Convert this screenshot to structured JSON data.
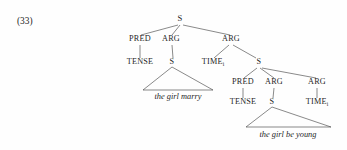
{
  "figure": {
    "example_number": "(33)",
    "caption_text": "",
    "type": "syntax-tree"
  },
  "tree": {
    "root": {
      "label": "S",
      "x": 180,
      "y": 21
    },
    "level1": [
      {
        "name": "pred-left",
        "label": "PRED",
        "x": 140,
        "y": 41
      },
      {
        "name": "arg-left",
        "label": "ARG",
        "x": 171,
        "y": 41
      },
      {
        "name": "arg-right",
        "label": "ARG",
        "x": 231,
        "y": 41
      }
    ],
    "level2": [
      {
        "name": "tense-left",
        "label": "TENSE",
        "x": 140,
        "y": 64
      },
      {
        "name": "s-left",
        "label": "S",
        "x": 172,
        "y": 64
      },
      {
        "name": "time-mid",
        "label": "TIME",
        "subscript": "i",
        "x": 213,
        "y": 64
      },
      {
        "name": "s-right",
        "label": "S",
        "x": 259,
        "y": 64
      }
    ],
    "level3": [
      {
        "name": "pred-embedded",
        "label": "PRED",
        "x": 243,
        "y": 84
      },
      {
        "name": "arg-embedded1",
        "label": "ARG",
        "x": 274,
        "y": 84
      },
      {
        "name": "arg-embedded2",
        "label": "ARG",
        "x": 317,
        "y": 84
      }
    ],
    "level4": [
      {
        "name": "tense-embedded",
        "label": "TENSE",
        "x": 243,
        "y": 104
      },
      {
        "name": "s-embedded",
        "label": "S",
        "x": 272,
        "y": 104
      },
      {
        "name": "time-embedded",
        "label": "TIME",
        "subscript": "i",
        "x": 317,
        "y": 104
      }
    ],
    "terminals": [
      {
        "name": "terminal-the-girl-marry",
        "text": "the girl marry",
        "apex_x": 172,
        "apex_y": 67,
        "left_x": 143,
        "right_x": 213,
        "base_y": 90,
        "text_x": 178,
        "text_y": 99
      },
      {
        "name": "terminal-the-girl-be-young",
        "text": "the girl be young",
        "apex_x": 272,
        "apex_y": 107,
        "left_x": 246,
        "right_x": 331,
        "base_y": 127,
        "text_x": 288,
        "text_y": 137
      }
    ],
    "edges": [
      {
        "name": "edge-root-pred-left",
        "x1": 178,
        "y1": 25,
        "x2": 141,
        "y2": 35
      },
      {
        "name": "edge-root-arg-left",
        "x1": 180,
        "y1": 25,
        "x2": 172,
        "y2": 35
      },
      {
        "name": "edge-root-arg-right",
        "x1": 183,
        "y1": 25,
        "x2": 230,
        "y2": 35
      },
      {
        "name": "edge-pred-left-tense",
        "x1": 140,
        "y1": 45,
        "x2": 140,
        "y2": 58
      },
      {
        "name": "edge-arg-left-s",
        "x1": 172,
        "y1": 45,
        "x2": 173,
        "y2": 58
      },
      {
        "name": "edge-arg-right-time",
        "x1": 229,
        "y1": 45,
        "x2": 214,
        "y2": 58
      },
      {
        "name": "edge-arg-right-s",
        "x1": 233,
        "y1": 45,
        "x2": 256,
        "y2": 58
      },
      {
        "name": "edge-s-right-pred",
        "x1": 257,
        "y1": 68,
        "x2": 244,
        "y2": 78
      },
      {
        "name": "edge-s-right-arg1",
        "x1": 260,
        "y1": 68,
        "x2": 274,
        "y2": 78
      },
      {
        "name": "edge-s-right-arg2",
        "x1": 262,
        "y1": 68,
        "x2": 316,
        "y2": 78
      },
      {
        "name": "edge-pred-emb-tense",
        "x1": 243,
        "y1": 88,
        "x2": 243,
        "y2": 98
      },
      {
        "name": "edge-arg-emb1-s",
        "x1": 274,
        "y1": 88,
        "x2": 273,
        "y2": 98
      },
      {
        "name": "edge-arg-emb2-time",
        "x1": 317,
        "y1": 88,
        "x2": 317,
        "y2": 98
      }
    ]
  }
}
